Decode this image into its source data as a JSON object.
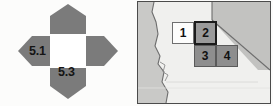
{
  "figure": {
    "background_color": "#fbfbfa",
    "panels": 2
  },
  "left_panel": {
    "name": "quadrant-compass-diagram",
    "background_color": "#fcfcfb",
    "arm_color": "#7b7b7b",
    "center_color": "#ffffff",
    "center_label": "",
    "arms": [
      {
        "direction": "north",
        "shape": "pentagon-up",
        "label": "",
        "color": "#7b7b7b"
      },
      {
        "direction": "east",
        "shape": "arrow-right",
        "label": "",
        "color": "#7b7b7b"
      },
      {
        "direction": "south",
        "shape": "pentagon-down",
        "label": "5.3",
        "color": "#7b7b7b"
      },
      {
        "direction": "west",
        "shape": "arrow-left",
        "label": "5.1",
        "color": "#7b7b7b"
      }
    ],
    "labels": {
      "west": "5.1",
      "south": "5.3"
    },
    "label_color": "#141414"
  },
  "right_panel": {
    "name": "map-inset",
    "border_color": "#4b4b4b",
    "land_color": "#f0f0ee",
    "ocean_color": "#c9c9c7",
    "neighbor_state_color": "#c2c2c0",
    "coastline_color": "#6d6d6d",
    "state_border_color": "#6d6d6d",
    "region": "california-nevada",
    "grid_cells": [
      {
        "id": 1,
        "label": "1",
        "fill": "#fdfdfc",
        "stroke": "#6f6f6f",
        "highlighted": false,
        "row": 0,
        "col": 0
      },
      {
        "id": 2,
        "label": "2",
        "fill": "#9a9a9a",
        "stroke": "#1b1b1b",
        "highlighted": true,
        "row": 0,
        "col": 1
      },
      {
        "id": 3,
        "label": "3",
        "fill": "#8e8e8e",
        "stroke": "#5a5a5a",
        "highlighted": false,
        "row": 1,
        "col": 1
      },
      {
        "id": 4,
        "label": "4",
        "fill": "#8e8e8e",
        "stroke": "#5a5a5a",
        "highlighted": false,
        "row": 1,
        "col": 2
      }
    ],
    "cell_label_color": "#111111"
  }
}
